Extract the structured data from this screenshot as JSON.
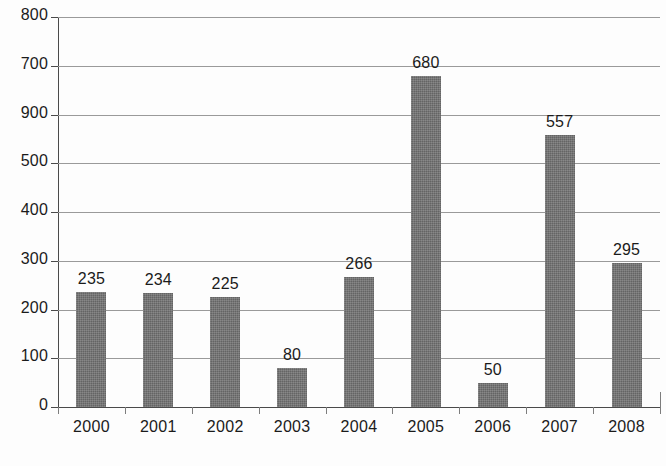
{
  "chart_data": {
    "type": "bar",
    "title": "",
    "subtitle": "",
    "xlabel": "",
    "ylabel": "",
    "categories": [
      "2000",
      "2001",
      "2002",
      "2003",
      "2004",
      "2005",
      "2006",
      "2007",
      "2008"
    ],
    "values": [
      235,
      234,
      225,
      80,
      266,
      680,
      50,
      557,
      295
    ],
    "data_labels": [
      "235",
      "234",
      "225",
      "80",
      "266",
      "680",
      "50",
      "557",
      "295"
    ],
    "y_tick_labels": [
      "800",
      "700",
      "900",
      "500",
      "400",
      "300",
      "200",
      "100",
      "0"
    ],
    "y_tick_values": [
      800,
      700,
      600,
      500,
      400,
      300,
      200,
      100,
      0
    ],
    "ylim": [
      0,
      800
    ],
    "grid": true,
    "legend": null,
    "legend_position": "none",
    "series_color": "#6e6e6e",
    "gridline_color": "#9a9a9a",
    "axis_color": "#4a4a4a",
    "text_color": "#1b1b1b",
    "note": "Third y-axis tick label is printed as 900 in the source scan although it lies between 700 and 500."
  },
  "caption": {
    "clipped_text": ""
  }
}
